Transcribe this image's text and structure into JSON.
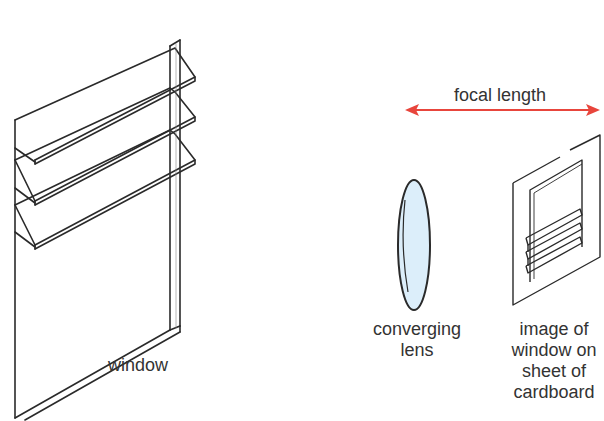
{
  "diagram": {
    "labels": {
      "window": "window",
      "focal_length": "focal length",
      "lens": [
        "converging",
        "lens"
      ],
      "image": [
        "image of",
        "window on",
        "sheet of",
        "cardboard"
      ]
    },
    "colors": {
      "arrow": "#e8453c",
      "stroke": "#2a2a2a",
      "lens_fill": "#dceefa",
      "text": "#333333"
    },
    "components": [
      {
        "id": "window",
        "description": "Louvered window frame with three open horizontal slats",
        "slat_count": 3
      },
      {
        "id": "converging-lens",
        "description": "Biconvex lens seen edge-on as an ellipse"
      },
      {
        "id": "cardboard-sheet",
        "description": "Sheet of cardboard showing an inverted image of the window",
        "slat_count": 3
      },
      {
        "id": "focal-length-arrow",
        "description": "Double-headed arrow spanning the distance from lens to cardboard"
      }
    ]
  }
}
